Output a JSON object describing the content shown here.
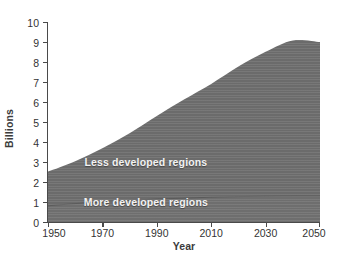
{
  "chart_data": {
    "type": "area",
    "title": "",
    "subtitle": "",
    "xlabel": "Year",
    "ylabel": "Billions",
    "xlim": [
      1950,
      2050
    ],
    "ylim": [
      0,
      10
    ],
    "grid": false,
    "legend_position": "inside-plot-annotations",
    "stacked": true,
    "xticks": [
      "1950",
      "1970",
      "1990",
      "2010",
      "2030",
      "2050"
    ],
    "xtick_values": [
      1950,
      1970,
      1990,
      2010,
      2030,
      2050
    ],
    "yticks": [
      "0",
      "1",
      "2",
      "3",
      "4",
      "5",
      "6",
      "7",
      "8",
      "9",
      "10"
    ],
    "ytick_values": [
      0,
      1,
      2,
      3,
      4,
      5,
      6,
      7,
      8,
      9,
      10
    ],
    "x": [
      1950,
      1960,
      1970,
      1980,
      1990,
      2000,
      2010,
      2020,
      2030,
      2040,
      2050
    ],
    "series": [
      {
        "name": "More developed regions",
        "color": "#6e6e6e",
        "values": [
          0.81,
          0.92,
          1.01,
          1.08,
          1.15,
          1.19,
          1.24,
          1.27,
          1.29,
          1.3,
          1.3
        ]
      },
      {
        "name": "Less developed regions",
        "color": "#6b6b6b",
        "values": [
          1.71,
          2.12,
          2.68,
          3.36,
          4.15,
          4.93,
          5.66,
          6.5,
          7.22,
          7.78,
          7.7
        ]
      }
    ],
    "totals": [
      2.52,
      3.04,
      3.69,
      4.44,
      5.3,
      6.12,
      6.9,
      7.77,
      8.51,
      9.08,
      9.0
    ],
    "annotations": [
      {
        "text": "Less developed regions",
        "x": 1986,
        "y": 3.0
      },
      {
        "text": "More developed regions",
        "x": 1986,
        "y": 1.0
      }
    ],
    "colors": {
      "area_fill": "#6b6b6b",
      "lower_band_fill": "#6e6e6e",
      "axis": "#4a4a4a",
      "tick_text": "#333333",
      "axis_title": "#3b3b3b",
      "annotation_text": "#f2f2f2",
      "background": "#ffffff"
    }
  }
}
